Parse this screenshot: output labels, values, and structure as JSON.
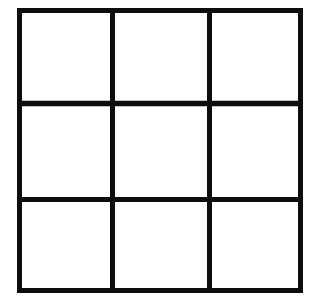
{
  "figure": {
    "name": "3x3-grid",
    "type": "grid",
    "rows": 3,
    "columns": 3,
    "cell_count": 9,
    "caption": "",
    "title": "",
    "labels": [],
    "colors": {
      "background": "#ffffff",
      "line": "#0d0d0d",
      "cell_fill": "#ffffff"
    },
    "geometry": {
      "outer_left": 17,
      "outer_top": 8,
      "outer_right": 303,
      "outer_bottom": 293,
      "outer_width": 286,
      "outer_height": 285,
      "vertical_divider_x": [
        112,
        209
      ],
      "horizontal_divider_y": [
        103,
        199
      ],
      "line_thickness": 5
    },
    "cells": [
      {
        "id": "cell-r1c1",
        "row": 1,
        "column": 1,
        "value": ""
      },
      {
        "id": "cell-r1c2",
        "row": 1,
        "column": 2,
        "value": ""
      },
      {
        "id": "cell-r1c3",
        "row": 1,
        "column": 3,
        "value": ""
      },
      {
        "id": "cell-r2c1",
        "row": 2,
        "column": 1,
        "value": ""
      },
      {
        "id": "cell-r2c2",
        "row": 2,
        "column": 2,
        "value": ""
      },
      {
        "id": "cell-r2c3",
        "row": 2,
        "column": 3,
        "value": ""
      },
      {
        "id": "cell-r3c1",
        "row": 3,
        "column": 1,
        "value": ""
      },
      {
        "id": "cell-r3c2",
        "row": 3,
        "column": 2,
        "value": ""
      },
      {
        "id": "cell-r3c3",
        "row": 3,
        "column": 3,
        "value": ""
      }
    ]
  }
}
